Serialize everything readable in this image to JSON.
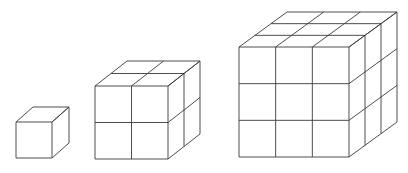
{
  "diagram": {
    "line_color": "#3a3a3a",
    "background": "#ffffff",
    "cubes": [
      {
        "name": "cube-1x1x1",
        "n": 1,
        "x": 16,
        "y": 122,
        "size": 36,
        "dx": 17,
        "dy": -15
      },
      {
        "name": "cube-2x2x2",
        "n": 2,
        "x": 95,
        "y": 86,
        "size": 73,
        "dx": 32,
        "dy": -25
      },
      {
        "name": "cube-3x3x3",
        "n": 3,
        "x": 239,
        "y": 47,
        "size": 110,
        "dx": 48,
        "dy": -35
      }
    ]
  }
}
